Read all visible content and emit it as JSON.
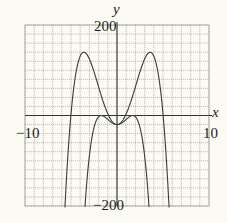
{
  "chart_data": {
    "type": "line",
    "title": "",
    "xlabel": "x",
    "ylabel": "y",
    "xlim": [
      -10,
      10
    ],
    "ylim": [
      -200,
      200
    ],
    "grid": true,
    "grid_step_x": 1,
    "grid_step_y": 20,
    "tick_labels": {
      "x_min": "−10",
      "x_max": "10",
      "y_max": "200",
      "y_min": "−200"
    },
    "series": [
      {
        "name": "outer curve",
        "x": [
          -5.7,
          -5.5,
          -5,
          -4.5,
          -4,
          -3.6,
          -3,
          -2.5,
          -2,
          -1.5,
          -1,
          -0.5,
          0,
          0.5,
          1,
          1.5,
          2,
          2.5,
          3,
          3.6,
          4,
          4.5,
          5,
          5.5,
          5.7
        ],
        "y": [
          -207,
          -172,
          -47,
          58,
          111,
          140,
          125,
          97,
          63,
          28,
          4,
          -14,
          -20,
          -14,
          4,
          28,
          63,
          97,
          125,
          140,
          111,
          58,
          -47,
          -172,
          -207
        ]
      },
      {
        "name": "inner curve",
        "x": [
          -3.5,
          -3.25,
          -3,
          -2.75,
          -2.5,
          -2.25,
          -2,
          -1.7,
          -1.5,
          -1,
          -0.5,
          0,
          0.5,
          1,
          1.5,
          1.7,
          2,
          2.25,
          2.5,
          2.75,
          3,
          3.25,
          3.5
        ],
        "y": [
          -208,
          -152,
          -107,
          -71,
          -44,
          -24,
          -10,
          0,
          -1,
          -9,
          -17,
          -20,
          -17,
          -9,
          -1,
          0,
          -10,
          -24,
          -44,
          -71,
          -107,
          -152,
          -208
        ]
      }
    ]
  },
  "labels": {
    "y_axis": "y",
    "x_axis": "x",
    "y_max": "200",
    "y_min": "−200",
    "x_min": "−10",
    "x_max": "10"
  }
}
